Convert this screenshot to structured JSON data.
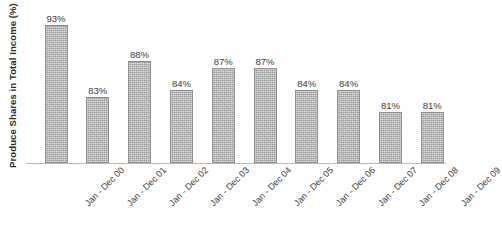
{
  "chart_data": {
    "type": "bar",
    "title": "",
    "xlabel": "",
    "ylabel": "Produce Shares in Total Income (%)",
    "categories": [
      "Jan - Dec 00",
      "Jan - Dec 01",
      "Jan - Dec 02",
      "Jan - Dec 03",
      "Jan - Dec 04",
      "Jan - Dec 05",
      "Jan - Dec 06",
      "Jan - Dec 07",
      "Jan - Dec 08",
      "Jan - Dec 09"
    ],
    "values": [
      93,
      83,
      88,
      84,
      87,
      87,
      84,
      84,
      81,
      81
    ],
    "data_labels": [
      "93%",
      "83%",
      "88%",
      "84%",
      "87%",
      "87%",
      "84%",
      "84%",
      "81%",
      "81%"
    ],
    "ylim": [
      75,
      94
    ],
    "grid": false,
    "legend": false,
    "legend_position": "none",
    "axis_ticks_y": false,
    "bar_color": "#a9a9a9",
    "bar_border_color": "#8d8d8d",
    "axis_line_color": "#b9b9b9",
    "text_color": "#3a3a3a",
    "background": "#ffffff"
  }
}
